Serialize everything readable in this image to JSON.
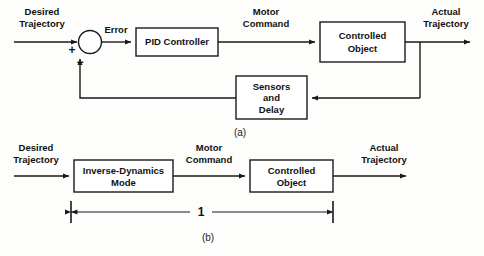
{
  "figure": {
    "panels": [
      {
        "id": "a",
        "caption": "(a)",
        "blocks": [
          {
            "name": "pid-controller",
            "lines": [
              "PID Controller"
            ]
          },
          {
            "name": "controlled-object",
            "lines": [
              "Controlled",
              "Object"
            ]
          },
          {
            "name": "sensors-and-delay",
            "lines": [
              "Sensors",
              "and",
              "Delay"
            ]
          }
        ],
        "summing_junction": {
          "name": "summing-junction",
          "plus_sign": "+",
          "minus_sign": "−"
        },
        "signals": [
          {
            "name": "desired-trajectory",
            "lines": [
              "Desired",
              "Trajectory"
            ]
          },
          {
            "name": "error",
            "lines": [
              "Error"
            ]
          },
          {
            "name": "motor-command",
            "lines": [
              "Motor",
              "Command"
            ]
          },
          {
            "name": "actual-trajectory",
            "lines": [
              "Actual",
              "Trajectory"
            ]
          }
        ]
      },
      {
        "id": "b",
        "caption": "(b)",
        "blocks": [
          {
            "name": "inverse-dynamics-mode",
            "lines": [
              "Inverse-Dynamics",
              "Mode"
            ]
          },
          {
            "name": "controlled-object",
            "lines": [
              "Controlled",
              "Object"
            ]
          }
        ],
        "signals": [
          {
            "name": "desired-trajectory",
            "lines": [
              "Desired",
              "Trajectory"
            ]
          },
          {
            "name": "motor-command",
            "lines": [
              "Motor",
              "Command"
            ]
          },
          {
            "name": "actual-trajectory",
            "lines": [
              "Actual",
              "Trajectory"
            ]
          }
        ],
        "dimension": {
          "name": "gain-dimension",
          "label": "1"
        }
      }
    ]
  },
  "text": {
    "desired": "Desired",
    "trajectory": "Trajectory",
    "error": "Error",
    "motor": "Motor",
    "command": "Command",
    "actual": "Actual",
    "pid_controller": "PID Controller",
    "controlled": "Controlled",
    "object": "Object",
    "sensors": "Sensors",
    "and": "and",
    "delay": "Delay",
    "inverse_dynamics": "Inverse-Dynamics",
    "mode": "Mode",
    "plus": "+",
    "minus": "−",
    "one": "1",
    "caption_a": "(a)",
    "caption_b": "(b)"
  },
  "colors": {
    "line": "#1a1a1a",
    "text": "#111111",
    "background": "#fdfdfc",
    "box_fill": "#ffffff"
  }
}
